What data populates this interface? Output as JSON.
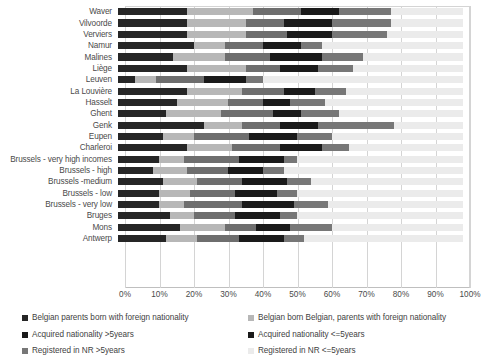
{
  "chart_data": {
    "type": "bar",
    "orientation": "horizontal",
    "stacked": true,
    "normalized_percent": true,
    "title": "",
    "xlabel": "",
    "ylabel": "",
    "xlim": [
      0,
      100
    ],
    "grid": true,
    "legend_position": "bottom",
    "xticks": [
      "0%",
      "10%",
      "20%",
      "30%",
      "40%",
      "50%",
      "60%",
      "70%",
      "80%",
      "90%",
      "100%"
    ],
    "xtick_values": [
      0,
      10,
      20,
      30,
      40,
      50,
      60,
      70,
      80,
      90,
      100
    ],
    "categories": [
      "Waver",
      "Vilvoorde",
      "Verviers",
      "Namur",
      "Malines",
      "Liège",
      "Leuven",
      "La Louvière",
      "Hasselt",
      "Ghent",
      "Genk",
      "Eupen",
      "Charleroi",
      "Brussels - very high incomes",
      "Brussels - high",
      "Brussels -medium",
      "Brussels - low",
      "Brussels - very low",
      "Bruges",
      "Mons",
      "Antwerp"
    ],
    "series": [
      {
        "name": "Belgian parents born with foreign nationality",
        "color": "#262626",
        "values": [
          20,
          20,
          20,
          22,
          16,
          20,
          5,
          20,
          17,
          14,
          25,
          13,
          20,
          12,
          10,
          13,
          12,
          12,
          15,
          18,
          14
        ]
      },
      {
        "name": "Belgian born Belgian, parents with foreign nationality",
        "color": "#b7b7b7",
        "values": [
          19,
          17,
          17,
          9,
          15,
          17,
          6,
          16,
          15,
          16,
          11,
          9,
          13,
          7,
          10,
          10,
          9,
          7,
          7,
          13,
          9
        ]
      },
      {
        "name": "Acquired nationality >5years",
        "color": "#6e6e6e",
        "values": [
          14,
          11,
          12,
          11,
          13,
          10,
          14,
          12,
          10,
          15,
          11,
          16,
          14,
          16,
          12,
          13,
          13,
          17,
          12,
          9,
          12
        ]
      },
      {
        "name": "Acquired nationality <=5years",
        "color": "#1a1a1a",
        "values": [
          11,
          14,
          13,
          11,
          15,
          11,
          12,
          9,
          8,
          8,
          11,
          14,
          12,
          13,
          10,
          13,
          12,
          15,
          13,
          10,
          13
        ]
      },
      {
        "name": "Registered in NR >5years",
        "color": "#777777",
        "values": [
          15,
          17,
          16,
          6,
          12,
          10,
          5,
          9,
          10,
          11,
          22,
          10,
          8,
          4,
          6,
          7,
          6,
          10,
          5,
          12,
          6
        ]
      },
      {
        "name": "Registered in NR <=5years",
        "color": "#ebebeb",
        "values": [
          21,
          21,
          22,
          41,
          29,
          32,
          58,
          34,
          40,
          36,
          20,
          38,
          33,
          48,
          52,
          44,
          48,
          39,
          48,
          38,
          46
        ]
      }
    ]
  },
  "legend": {
    "left": [
      {
        "label": "Belgian parents born with foreign nationality",
        "color": "#262626"
      },
      {
        "label": "Acquired nationality >5years",
        "color": "#1a1a1a"
      },
      {
        "label": "Registered in NR >5years",
        "color": "#777777"
      }
    ],
    "right": [
      {
        "label": "Belgian born Belgian, parents with foreign nationality",
        "color": "#b7b7b7"
      },
      {
        "label": "Acquired nationality <=5years",
        "color": "#1a1a1a"
      },
      {
        "label": "Registered in NR <=5years",
        "color": "#ebebeb"
      }
    ]
  }
}
